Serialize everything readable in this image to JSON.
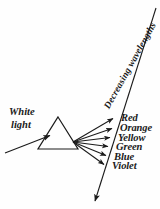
{
  "figure": {
    "background_color": "#fefefe",
    "ink_color": "#1a1a1a"
  },
  "source_label": {
    "line1": "White",
    "line2": "light"
  },
  "axis": {
    "label": "Decreasing wavelengths",
    "direction": "downward-left",
    "arrowhead": "bottom"
  },
  "prism": {
    "name": "triangular-prism",
    "apex": {
      "x": 58,
      "y": 117
    },
    "base_left": {
      "x": 38,
      "y": 149
    },
    "base_right": {
      "x": 78,
      "y": 149
    }
  },
  "spectrum": [
    {
      "name": "Red",
      "label": "Red",
      "color": "#cc2222"
    },
    {
      "name": "Orange",
      "label": "Orange",
      "color": "#e07818"
    },
    {
      "name": "Yellow",
      "label": "Yellow",
      "color": "#d8c220"
    },
    {
      "name": "Green",
      "label": "Green",
      "color": "#2f9b3f"
    },
    {
      "name": "Blue",
      "label": "Blue",
      "color": "#2a50bb"
    },
    {
      "name": "Violet",
      "label": "Violet",
      "color": "#6a2fa0"
    }
  ]
}
